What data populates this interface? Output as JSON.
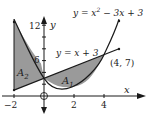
{
  "figure": {
    "type": "area-between-curves",
    "curves": [
      {
        "name": "parabola",
        "label": "y = x² − 3x + 3",
        "label_parts": {
          "lhs": "y = x",
          "exp": "2",
          "rhs": " − 3x + 3"
        },
        "x_range": [
          -2,
          5
        ]
      },
      {
        "name": "line",
        "label": "y = x + 3",
        "x_range": [
          -2,
          5
        ]
      }
    ],
    "intersection_points": [
      {
        "label": "(4, 7)",
        "x": 4,
        "y": 7
      },
      {
        "x": 0,
        "y": 3
      }
    ],
    "regions": [
      {
        "label_main": "A",
        "label_sub": "1",
        "between_x": [
          0,
          4
        ]
      },
      {
        "label_main": "A",
        "label_sub": "2",
        "between_x": [
          -2,
          0
        ]
      }
    ],
    "axes": {
      "x_label": "x",
      "y_label": "y",
      "origin_label": "O",
      "x_ticks": [
        {
          "value": -2,
          "label": "−2"
        },
        {
          "value": 2,
          "label": "2"
        },
        {
          "value": 4,
          "label": "4"
        }
      ],
      "y_ticks": [
        {
          "value": 6,
          "label": "6"
        },
        {
          "value": 12,
          "label": "12"
        }
      ]
    },
    "colors": {
      "fill": "#9a9a9a",
      "stroke": "#1a1a1a",
      "background": "#ffffff"
    }
  }
}
